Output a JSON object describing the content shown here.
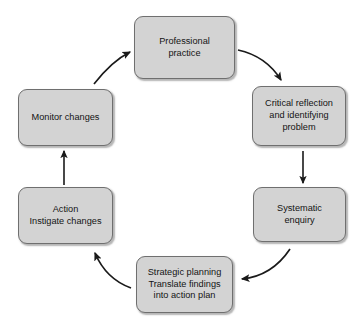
{
  "diagram": {
    "type": "cycle-flowchart",
    "colors": {
      "node_fill": "#d3d3d3",
      "node_border": "#6f6f6f",
      "arrow": "#1a1a1a",
      "background": "#ffffff",
      "text": "#141414"
    },
    "nodes": [
      {
        "id": "professional-practice",
        "label": "Professional\npractice"
      },
      {
        "id": "critical-reflection",
        "label": "Critical reflection\nand identifying\nproblem"
      },
      {
        "id": "systematic-enquiry",
        "label": "Systematic\nenquiry"
      },
      {
        "id": "strategic-planning",
        "label": "Strategic planning\nTranslate findings\ninto action plan"
      },
      {
        "id": "action",
        "label": "Action\nInstigate changes"
      },
      {
        "id": "monitor-changes",
        "label": "Monitor changes"
      }
    ],
    "arrows": [
      {
        "id": "professional-practice-to-critical-reflection",
        "from": "professional-practice",
        "to": "critical-reflection",
        "style": "curved"
      },
      {
        "id": "critical-reflection-to-systematic-enquiry",
        "from": "critical-reflection",
        "to": "systematic-enquiry",
        "style": "straight-vertical-down"
      },
      {
        "id": "systematic-enquiry-to-strategic-planning",
        "from": "systematic-enquiry",
        "to": "strategic-planning",
        "style": "curved"
      },
      {
        "id": "strategic-planning-to-action",
        "from": "strategic-planning",
        "to": "action",
        "style": "curved"
      },
      {
        "id": "action-to-monitor-changes",
        "from": "action",
        "to": "monitor-changes",
        "style": "straight-vertical-up"
      },
      {
        "id": "monitor-changes-to-professional-practice",
        "from": "monitor-changes",
        "to": "professional-practice",
        "style": "curved"
      }
    ]
  }
}
